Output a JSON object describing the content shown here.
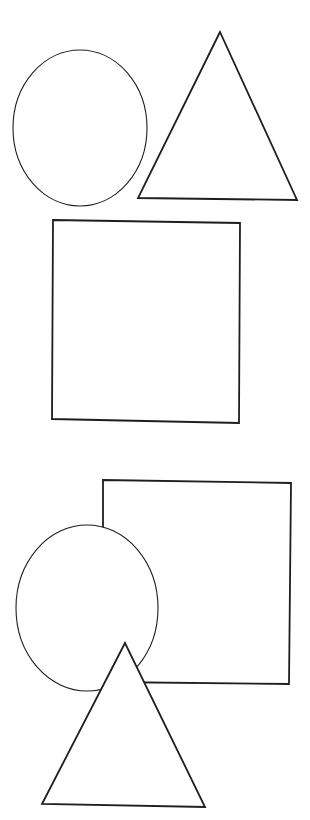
{
  "figure": {
    "stroke_color": "#1e1e1e",
    "background": "#ffffff"
  },
  "groups": [
    {
      "name": "separate-shapes",
      "shapes": [
        {
          "type": "oval",
          "cx": 80,
          "cy": 128,
          "rx": 67,
          "ry": 78
        },
        {
          "type": "triangle",
          "points": "220,32 138,198 297,200"
        },
        {
          "type": "square",
          "points": "53,220 240,223 239,423 52,419"
        }
      ]
    },
    {
      "name": "overlapping-shapes",
      "layer_order": [
        "square",
        "oval",
        "triangle"
      ],
      "shapes": [
        {
          "type": "square",
          "points": "103,480 291,483 289,684 103,682"
        },
        {
          "type": "oval",
          "cx": 87,
          "cy": 608,
          "rx": 71,
          "ry": 83
        },
        {
          "type": "triangle",
          "points": "125,643 42,804 205,807"
        }
      ]
    }
  ]
}
